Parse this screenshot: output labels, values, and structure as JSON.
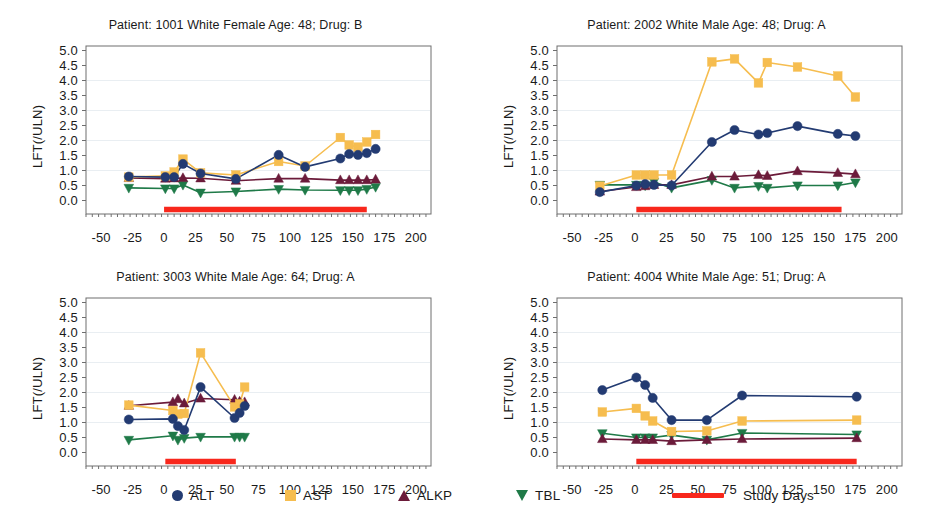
{
  "figure": {
    "ylabel": "LFT(/ULN)",
    "y_ticks": [
      "5.0",
      "4.5",
      "4.0",
      "3.5",
      "3.0",
      "2.5",
      "2.0",
      "1.5",
      "1.0",
      "0.5",
      "0.0"
    ],
    "x_ticks": [
      "-50",
      "-25",
      "0",
      "25",
      "50",
      "75",
      "100",
      "125",
      "150",
      "175",
      "200"
    ],
    "ylim": [
      -0.45,
      5.15
    ],
    "xlim": [
      -62,
      212
    ],
    "colors": {
      "ALT": "#233b72",
      "AST": "#f6bd4f",
      "ALKP": "#6b1b3a",
      "TBL": "#1f7a48",
      "study_days": "#f8271c",
      "axis": "#6e6e6e",
      "grid": "#e9eef2"
    }
  },
  "legend": {
    "items": [
      {
        "label": "ALT",
        "marker": "circle-marker",
        "color": "#233b72"
      },
      {
        "label": "AST",
        "marker": "square-marker",
        "color": "#f6bd4f"
      },
      {
        "label": "ALKP",
        "marker": "triangle-up-marker",
        "color": "#6b1b3a"
      },
      {
        "label": "TBL",
        "marker": "triangle-down-marker",
        "color": "#1f7a48"
      },
      {
        "label": "Study Days",
        "marker": "line-marker",
        "color": "#f8271c"
      }
    ]
  },
  "chart_data": [
    {
      "type": "line",
      "title": "Patient: 1001 White Female Age: 48; Drug: B",
      "xlabel": "",
      "ylabel": "LFT(/ULN)",
      "xlim": [
        -62,
        212
      ],
      "ylim": [
        -0.45,
        5.15
      ],
      "grid": false,
      "legend_position": "figure-bottom",
      "study_days": {
        "start": 0,
        "end": 161,
        "y": -0.3
      },
      "series": [
        {
          "name": "ALT",
          "color": "#233b72",
          "x": [
            -28,
            1,
            8,
            15,
            29,
            57,
            91,
            112,
            140,
            147,
            154,
            161,
            168
          ],
          "y": [
            0.8,
            0.78,
            0.78,
            1.22,
            0.9,
            0.72,
            1.52,
            1.12,
            1.4,
            1.55,
            1.52,
            1.58,
            1.72
          ]
        },
        {
          "name": "AST",
          "color": "#f6bd4f",
          "x": [
            -28,
            1,
            8,
            15,
            29,
            57,
            91,
            112,
            140,
            147,
            154,
            161,
            168
          ],
          "y": [
            0.78,
            0.82,
            0.95,
            1.38,
            0.92,
            0.85,
            1.3,
            1.15,
            2.1,
            1.85,
            1.78,
            1.95,
            2.2
          ]
        },
        {
          "name": "ALKP",
          "color": "#6b1b3a",
          "x": [
            -28,
            1,
            8,
            15,
            29,
            57,
            91,
            112,
            140,
            147,
            154,
            161,
            168
          ],
          "y": [
            0.75,
            0.73,
            0.74,
            0.75,
            0.74,
            0.66,
            0.73,
            0.73,
            0.68,
            0.68,
            0.68,
            0.68,
            0.7
          ]
        },
        {
          "name": "TBL",
          "color": "#1f7a48",
          "x": [
            -28,
            1,
            8,
            15,
            29,
            57,
            91,
            112,
            140,
            147,
            154,
            161,
            168
          ],
          "y": [
            0.42,
            0.4,
            0.4,
            0.52,
            0.26,
            0.3,
            0.38,
            0.35,
            0.34,
            0.34,
            0.34,
            0.38,
            0.45
          ]
        }
      ]
    },
    {
      "type": "line",
      "title": "Patient: 2002 White Male Age: 48; Drug: A",
      "xlabel": "",
      "ylabel": "LFT(/ULN)",
      "xlim": [
        -62,
        212
      ],
      "ylim": [
        -0.45,
        5.15
      ],
      "grid": false,
      "legend_position": "figure-bottom",
      "study_days": {
        "start": 1,
        "end": 164,
        "y": -0.3
      },
      "series": [
        {
          "name": "ALT",
          "color": "#233b72",
          "x": [
            -28,
            1,
            8,
            15,
            29,
            61,
            79,
            98,
            105,
            129,
            161,
            175
          ],
          "y": [
            0.28,
            0.5,
            0.55,
            0.52,
            0.5,
            1.95,
            2.35,
            2.2,
            2.25,
            2.48,
            2.22,
            2.15
          ]
        },
        {
          "name": "AST",
          "color": "#f6bd4f",
          "x": [
            -28,
            1,
            8,
            15,
            29,
            61,
            79,
            98,
            105,
            129,
            161,
            175
          ],
          "y": [
            0.48,
            0.85,
            0.85,
            0.85,
            0.85,
            4.62,
            4.72,
            3.92,
            4.6,
            4.45,
            4.15,
            3.45
          ]
        },
        {
          "name": "ALKP",
          "color": "#6b1b3a",
          "x": [
            -28,
            1,
            8,
            15,
            29,
            61,
            79,
            98,
            105,
            129,
            161,
            175
          ],
          "y": [
            0.3,
            0.45,
            0.48,
            0.52,
            0.52,
            0.8,
            0.8,
            0.85,
            0.82,
            0.98,
            0.92,
            0.88
          ]
        },
        {
          "name": "TBL",
          "color": "#1f7a48",
          "x": [
            -28,
            1,
            8,
            15,
            29,
            61,
            79,
            98,
            105,
            129,
            161,
            175
          ],
          "y": [
            0.52,
            0.52,
            0.5,
            0.62,
            0.42,
            0.68,
            0.42,
            0.48,
            0.42,
            0.5,
            0.5,
            0.6
          ]
        }
      ]
    },
    {
      "type": "line",
      "title": "Patient: 3003 White Male Age: 64; Drug: A",
      "xlabel": "",
      "ylabel": "LFT(/ULN)",
      "xlim": [
        -62,
        212
      ],
      "ylim": [
        -0.45,
        5.15
      ],
      "grid": false,
      "legend_position": "figure-bottom",
      "study_days": {
        "start": 1,
        "end": 57,
        "y": -0.3
      },
      "series": [
        {
          "name": "ALT",
          "color": "#233b72",
          "x": [
            -28,
            7,
            11,
            16,
            29,
            56,
            60,
            64
          ],
          "y": [
            1.1,
            1.12,
            0.88,
            0.75,
            2.18,
            1.15,
            1.32,
            1.55
          ]
        },
        {
          "name": "AST",
          "color": "#f6bd4f",
          "x": [
            -28,
            7,
            11,
            16,
            29,
            56,
            60,
            64
          ],
          "y": [
            1.58,
            1.4,
            1.28,
            1.3,
            3.32,
            1.52,
            1.62,
            2.18
          ]
        },
        {
          "name": "ALKP",
          "color": "#6b1b3a",
          "x": [
            -28,
            7,
            11,
            16,
            29,
            56,
            60,
            64
          ],
          "y": [
            1.56,
            1.68,
            1.78,
            1.64,
            1.8,
            1.76,
            1.7,
            1.68
          ]
        },
        {
          "name": "TBL",
          "color": "#1f7a48",
          "x": [
            -28,
            7,
            11,
            16,
            29,
            56,
            60,
            64
          ],
          "y": [
            0.42,
            0.56,
            0.42,
            0.48,
            0.52,
            0.52,
            0.52,
            0.52
          ]
        }
      ]
    },
    {
      "type": "line",
      "title": "Patient: 4004 White Male Age: 51; Drug: A",
      "xlabel": "",
      "ylabel": "LFT(/ULN)",
      "xlim": [
        -62,
        212
      ],
      "ylim": [
        -0.45,
        5.15
      ],
      "grid": false,
      "legend_position": "figure-bottom",
      "study_days": {
        "start": 1,
        "end": 176,
        "y": -0.3
      },
      "series": [
        {
          "name": "ALT",
          "color": "#233b72",
          "x": [
            -26,
            1,
            8,
            14,
            29,
            57,
            85,
            176
          ],
          "y": [
            2.08,
            2.5,
            2.25,
            1.82,
            1.08,
            1.08,
            1.9,
            1.86
          ]
        },
        {
          "name": "AST",
          "color": "#f6bd4f",
          "x": [
            -26,
            1,
            8,
            14,
            29,
            57,
            85,
            176
          ],
          "y": [
            1.35,
            1.47,
            1.22,
            1.05,
            0.7,
            0.72,
            1.05,
            1.08
          ]
        },
        {
          "name": "ALKP",
          "color": "#6b1b3a",
          "x": [
            -26,
            1,
            8,
            14,
            29,
            57,
            85,
            176
          ],
          "y": [
            0.45,
            0.42,
            0.42,
            0.42,
            0.38,
            0.42,
            0.45,
            0.48
          ]
        },
        {
          "name": "TBL",
          "color": "#1f7a48",
          "x": [
            -26,
            1,
            8,
            14,
            29,
            57,
            85,
            176
          ],
          "y": [
            0.64,
            0.5,
            0.5,
            0.5,
            0.58,
            0.42,
            0.65,
            0.6
          ]
        }
      ]
    }
  ]
}
